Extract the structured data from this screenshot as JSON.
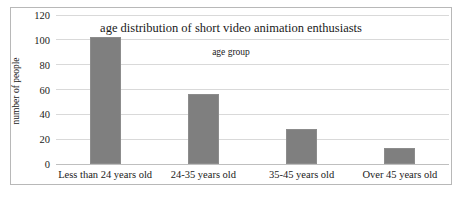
{
  "chart_data": {
    "type": "bar",
    "title": "age distribution of short video animation enthusiasts",
    "subtitle": "age group",
    "xlabel": "age group",
    "ylabel": "number of people",
    "categories": [
      "Less than 24 years old",
      "24-35 years old",
      "35-45 years old",
      "Over 45 years old"
    ],
    "values": [
      102,
      56,
      28,
      13
    ],
    "ylim": [
      0,
      120
    ],
    "yticks": [
      0,
      20,
      40,
      60,
      80,
      100,
      120
    ],
    "ytick_labels": [
      "0",
      "20",
      "40",
      "60",
      "80",
      "100",
      "120"
    ],
    "grid": true,
    "legend": false,
    "bar_color": "#7f7f7f",
    "gridline_color": "#d9d9d9",
    "border_color": "#b8b8b8",
    "text_color": "#1a1a1a"
  }
}
